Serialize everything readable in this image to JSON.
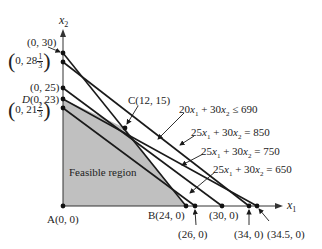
{
  "diagram": {
    "axes": {
      "x_label": "x",
      "x_sub": "1",
      "y_label": "x",
      "y_sub": "2"
    },
    "points": {
      "A": "A(0, 0)",
      "B": "B(24, 0)",
      "C": "C(12, 15)",
      "D": "D(0, 23)",
      "y30": "(0, 30)",
      "y28": {
        "prefix": "0, 28",
        "num": "1",
        "den": "3"
      },
      "y25": "(0, 25)",
      "y21": {
        "prefix": "0, 21",
        "num": "2",
        "den": "3"
      },
      "x26": "(26, 0)",
      "x30": "(30, 0)",
      "x34": "(34, 0)",
      "x345": "(34.5, 0)"
    },
    "region_label": "Feasible region",
    "region_color": "#c0c0c0",
    "line_color": "#1a1a1a",
    "lines": [
      {
        "label_a": "20",
        "label_b": " + 30",
        "label_c": " ≤ 690"
      },
      {
        "label_a": "25",
        "label_b": " + 30",
        "label_c": " = 850"
      },
      {
        "label_a": "25",
        "label_b": " + 30",
        "label_c": " = 750"
      },
      {
        "label_a": "25",
        "label_b": " + 30",
        "label_c": " = 650"
      }
    ]
  }
}
